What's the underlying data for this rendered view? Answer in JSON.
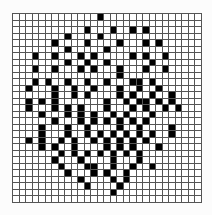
{
  "grid": {
    "rows": 29,
    "cols": 29,
    "colors": {
      "filled": "#000000",
      "empty": "#ffffff",
      "line": "#555555"
    },
    "filled_cells": {
      "0": [
        13
      ],
      "2": [
        11,
        15,
        18,
        20
      ],
      "3": [
        8,
        13
      ],
      "4": [
        6,
        11,
        16,
        20,
        22
      ],
      "5": [
        8,
        14
      ],
      "6": [
        3,
        6,
        10,
        12,
        18,
        20,
        23
      ],
      "7": [
        8,
        11,
        14,
        21
      ],
      "8": [
        3,
        6,
        10,
        12,
        16,
        20,
        23
      ],
      "9": [
        16
      ],
      "10": [
        3,
        5,
        8,
        11,
        14,
        18,
        19,
        21
      ],
      "11": [
        2,
        6,
        9,
        12,
        16,
        19,
        22
      ],
      "12": [
        6,
        9,
        11,
        16,
        18,
        21,
        24
      ],
      "13": [
        2,
        4,
        6,
        14,
        17,
        19,
        20,
        22,
        24
      ],
      "14": [
        2,
        6,
        8,
        10,
        14,
        18,
        20,
        23,
        25
      ],
      "15": [
        4,
        8,
        10,
        12,
        15,
        17,
        21
      ],
      "16": [
        6,
        10,
        12,
        14,
        16,
        18,
        20
      ],
      "17": [
        4,
        8,
        11,
        16,
        19,
        24
      ],
      "18": [
        4,
        8,
        11,
        13,
        15,
        17,
        19,
        21,
        24
      ],
      "19": [
        2,
        4,
        7,
        9,
        12,
        14,
        16,
        18,
        20
      ],
      "20": [
        4,
        6,
        9,
        14,
        16,
        18,
        22
      ],
      "21": [
        7,
        9,
        11,
        13,
        15,
        17,
        19
      ],
      "22": [
        6,
        10,
        15,
        19
      ],
      "23": [
        7,
        11,
        12,
        15,
        18,
        21
      ],
      "24": [
        8,
        12,
        14,
        17
      ],
      "25": [
        10,
        15,
        17
      ],
      "26": [
        11,
        16
      ],
      "27": [
        15
      ]
    }
  }
}
